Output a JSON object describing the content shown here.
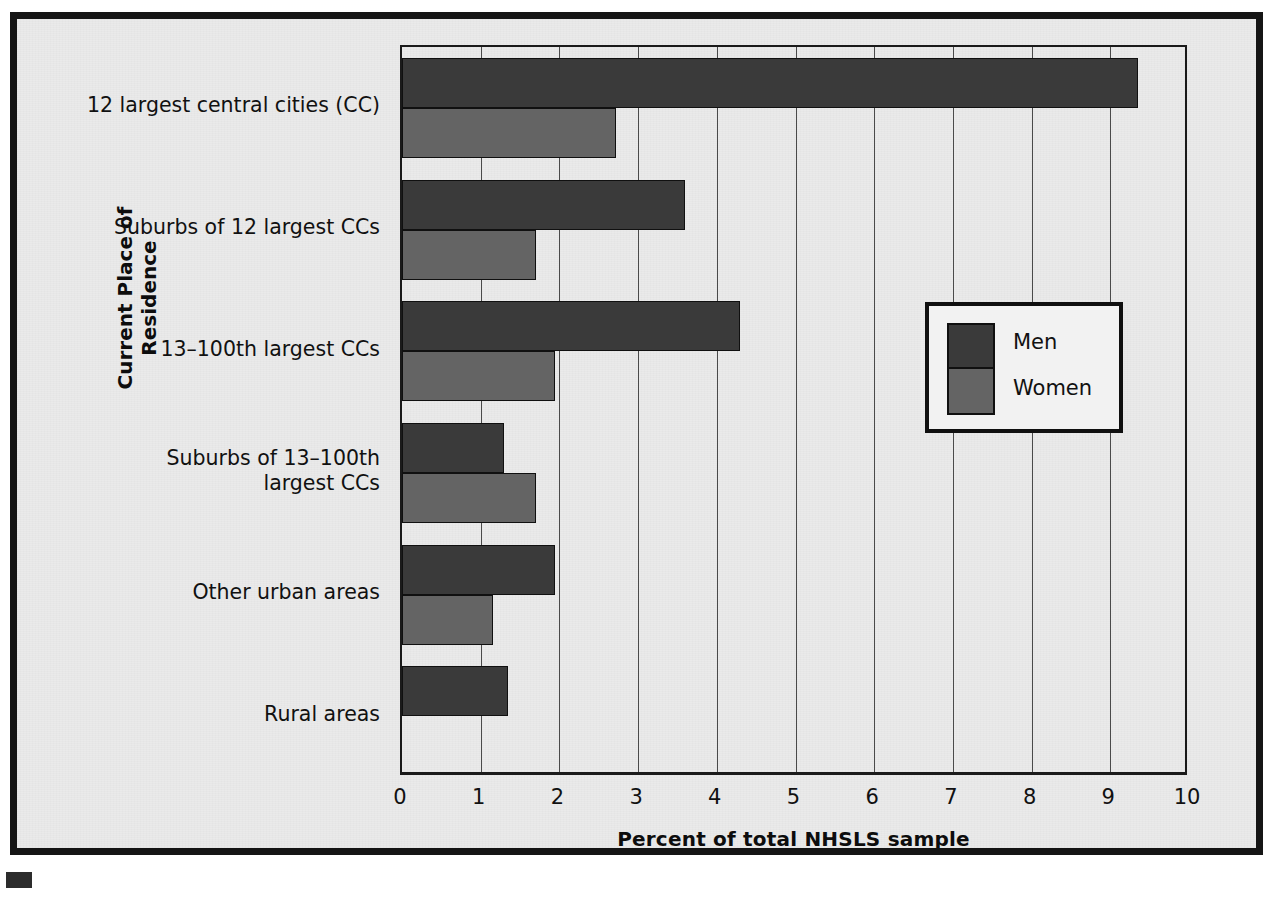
{
  "chart_data": {
    "type": "bar",
    "orientation": "horizontal",
    "title": "",
    "xlabel": "Percent of total NHSLS sample",
    "ylabel": "Current Place of Residence",
    "xlim": [
      0,
      10
    ],
    "xticks": [
      0,
      1,
      2,
      3,
      4,
      5,
      6,
      7,
      8,
      9,
      10
    ],
    "xtick_labels": [
      "0",
      "1",
      "2",
      "3",
      "4",
      "5",
      "6",
      "7",
      "8",
      "9",
      "10"
    ],
    "grid": "vertical",
    "legend_position": "center-right",
    "categories": [
      "12 largest central cities (CC)",
      "Suburbs of 12 largest CCs",
      "13–100th largest CCs",
      "Suburbs of 13–100th\nlargest CCs",
      "Other urban areas",
      "Rural areas"
    ],
    "series": [
      {
        "name": "Men",
        "color": "#3a3a3a",
        "values": [
          9.35,
          3.6,
          4.3,
          1.3,
          1.95,
          1.35
        ]
      },
      {
        "name": "Women",
        "color": "#646464",
        "values": [
          2.72,
          1.7,
          1.95,
          1.7,
          1.15,
          null
        ]
      }
    ]
  },
  "legend": {
    "entries": [
      {
        "label": "Men",
        "color": "#3a3a3a"
      },
      {
        "label": "Women",
        "color": "#646464"
      }
    ]
  },
  "axes": {
    "x_title": "Percent of total NHSLS sample",
    "y_title": "Current Place of Residence"
  },
  "colors": {
    "men": "#3a3a3a",
    "women": "#646464",
    "frame": "#151515",
    "background": "#eaeaea",
    "gridline": "#4a4a4a"
  }
}
